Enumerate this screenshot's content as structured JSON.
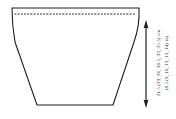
{
  "schematic": {
    "height_cm": "21.5 (23, 26, 30.5, 33, 35.5) cm",
    "height_in": "(8.5 (9, 10, 12, 13, 14) in)"
  },
  "icons": {
    "arrow": "vertical-double-headed-measurement-arrow",
    "dashed_line": "fold-or-pickup-dashed-line"
  },
  "colors": {
    "line": "#1f1f1f",
    "background": "#ffffff"
  }
}
